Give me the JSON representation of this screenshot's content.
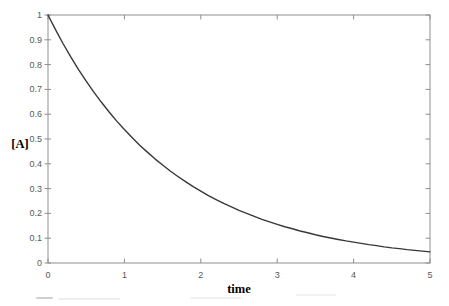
{
  "chart_data": {
    "type": "line",
    "title": "",
    "xlabel": "time",
    "ylabel": "[A]",
    "xlim": [
      0,
      5
    ],
    "ylim": [
      0,
      1
    ],
    "grid": false,
    "legend": "none",
    "frame": "box with inward mirrored ticks on top and right",
    "x_ticks": [
      {
        "label": "0",
        "value": 0
      },
      {
        "label": "1",
        "value": 1
      },
      {
        "label": "2",
        "value": 2
      },
      {
        "label": "3",
        "value": 3
      },
      {
        "label": "4",
        "value": 4
      },
      {
        "label": "5",
        "value": 5
      }
    ],
    "y_ticks": [
      {
        "label": "1",
        "value": 1.0
      },
      {
        "label": "0.9",
        "value": 0.9
      },
      {
        "label": "0.8",
        "value": 0.8
      },
      {
        "label": "0.7",
        "value": 0.7
      },
      {
        "label": "0.6",
        "value": 0.6
      },
      {
        "label": "0.5",
        "value": 0.5
      },
      {
        "label": "0.4",
        "value": 0.4
      },
      {
        "label": "0.3",
        "value": 0.3
      },
      {
        "label": "0.2",
        "value": 0.2
      },
      {
        "label": "0.1",
        "value": 0.1
      },
      {
        "label": "0",
        "value": 0.0
      }
    ],
    "series": [
      {
        "name": "[A] concentration decay curve",
        "x": [
          0,
          0.1,
          0.2,
          0.3,
          0.4,
          0.5,
          0.6,
          0.7,
          0.8,
          0.9,
          1.0,
          1.1,
          1.2,
          1.3,
          1.4,
          1.5,
          1.6,
          1.7,
          1.8,
          1.9,
          2.0,
          2.1,
          2.2,
          2.3,
          2.4,
          2.5,
          2.6,
          2.7,
          2.8,
          2.9,
          3.0,
          3.1,
          3.2,
          3.3,
          3.4,
          3.5,
          3.6,
          3.7,
          3.8,
          3.9,
          4.0,
          4.1,
          4.2,
          4.3,
          4.4,
          4.5,
          4.6,
          4.7,
          4.8,
          4.9,
          5.0
        ],
        "y": [
          1.0,
          0.94,
          0.883,
          0.83,
          0.78,
          0.733,
          0.689,
          0.648,
          0.609,
          0.572,
          0.538,
          0.506,
          0.475,
          0.447,
          0.42,
          0.395,
          0.371,
          0.349,
          0.328,
          0.308,
          0.29,
          0.272,
          0.256,
          0.24,
          0.226,
          0.212,
          0.2,
          0.188,
          0.176,
          0.166,
          0.156,
          0.146,
          0.138,
          0.129,
          0.122,
          0.114,
          0.107,
          0.101,
          0.095,
          0.089,
          0.084,
          0.079,
          0.074,
          0.07,
          0.065,
          0.061,
          0.058,
          0.054,
          0.051,
          0.048,
          0.045
        ]
      }
    ],
    "colors": {
      "curve": "#383838",
      "frame": "#8f8f8f",
      "tick": "#8f8f8f",
      "tick_label": "#595959",
      "axis_label": "#000000",
      "background": "#ffffff"
    }
  }
}
